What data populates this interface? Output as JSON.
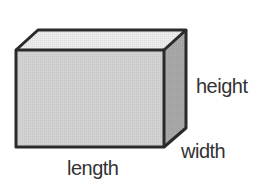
{
  "diagram": {
    "type": "rectangular-prism",
    "labels": {
      "height": "height",
      "width": "width",
      "length": "length"
    },
    "colors": {
      "front_face": "#d2d2d2",
      "top_face": "#ebebeb",
      "side_face": "#a8a8a8",
      "edge": "#2a2a2a",
      "label_text": "#333333"
    }
  }
}
